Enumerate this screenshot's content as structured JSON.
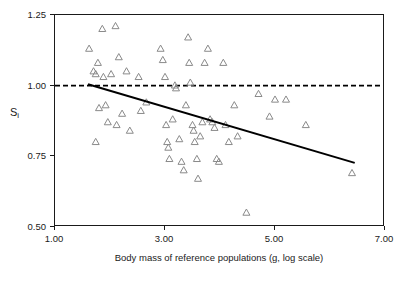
{
  "chart_data": {
    "type": "scatter",
    "title": "",
    "xlabel": "Body mass of reference populations (g, log scale)",
    "ylabel": "S",
    "ylabel_sub": "i",
    "xlim": [
      1.0,
      7.0
    ],
    "ylim": [
      0.5,
      1.25
    ],
    "xticks": [
      1.0,
      3.0,
      5.0,
      7.0
    ],
    "xtick_labels": [
      "1.00",
      "3.00",
      "5.00",
      "7.00"
    ],
    "yticks": [
      0.5,
      0.75,
      1.0,
      1.25
    ],
    "ytick_labels": [
      "0.50",
      "0.75",
      "1.00",
      "1.25"
    ],
    "grid": false,
    "legend": null,
    "marker": "open-triangle",
    "marker_color": "#8a8a8a",
    "reference_line": {
      "name": "dashed-reference",
      "y": 1.0,
      "style": "dashed",
      "color": "#000000"
    },
    "trend_line": {
      "name": "regression-line",
      "x": [
        1.6,
        6.45
      ],
      "y": [
        1.005,
        0.727
      ],
      "style": "solid",
      "color": "#000000"
    },
    "points": [
      [
        1.62,
        1.13
      ],
      [
        1.7,
        1.05
      ],
      [
        1.74,
        1.04
      ],
      [
        1.78,
        1.08
      ],
      [
        1.86,
        1.2
      ],
      [
        1.88,
        1.03
      ],
      [
        1.92,
        0.93
      ],
      [
        1.96,
        0.87
      ],
      [
        1.74,
        0.8
      ],
      [
        1.8,
        0.92
      ],
      [
        2.02,
        1.04
      ],
      [
        2.1,
        1.21
      ],
      [
        2.12,
        0.86
      ],
      [
        2.16,
        1.1
      ],
      [
        2.22,
        0.9
      ],
      [
        2.3,
        1.05
      ],
      [
        2.36,
        0.84
      ],
      [
        2.52,
        1.03
      ],
      [
        2.56,
        0.91
      ],
      [
        2.66,
        0.94
      ],
      [
        2.92,
        1.13
      ],
      [
        2.96,
        1.09
      ],
      [
        3.0,
        1.03
      ],
      [
        3.02,
        0.86
      ],
      [
        3.04,
        0.8
      ],
      [
        3.06,
        0.78
      ],
      [
        3.08,
        0.74
      ],
      [
        3.14,
        0.88
      ],
      [
        3.18,
        1.0
      ],
      [
        3.2,
        0.99
      ],
      [
        3.26,
        0.81
      ],
      [
        3.3,
        0.73
      ],
      [
        3.34,
        0.7
      ],
      [
        3.38,
        0.93
      ],
      [
        3.42,
        1.17
      ],
      [
        3.44,
        1.08
      ],
      [
        3.46,
        1.01
      ],
      [
        3.5,
        0.86
      ],
      [
        3.52,
        0.84
      ],
      [
        3.54,
        0.8
      ],
      [
        3.58,
        0.74
      ],
      [
        3.6,
        0.67
      ],
      [
        3.64,
        0.82
      ],
      [
        3.68,
        0.87
      ],
      [
        3.72,
        1.08
      ],
      [
        3.78,
        1.13
      ],
      [
        3.82,
        0.88
      ],
      [
        3.86,
        0.87
      ],
      [
        3.9,
        0.85
      ],
      [
        3.94,
        0.74
      ],
      [
        3.98,
        0.73
      ],
      [
        4.06,
        1.08
      ],
      [
        4.1,
        0.86
      ],
      [
        4.16,
        0.8
      ],
      [
        4.26,
        0.93
      ],
      [
        4.32,
        0.82
      ],
      [
        4.48,
        0.55
      ],
      [
        4.7,
        0.97
      ],
      [
        4.9,
        0.89
      ],
      [
        5.0,
        0.95
      ],
      [
        5.2,
        0.95
      ],
      [
        5.56,
        0.86
      ],
      [
        6.4,
        0.69
      ]
    ]
  }
}
